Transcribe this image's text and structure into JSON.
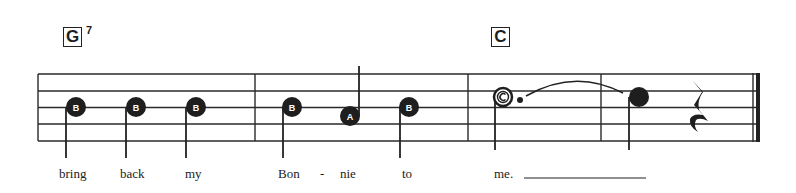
{
  "chords": [
    {
      "root": "G",
      "sup": "7"
    },
    {
      "root": "C",
      "sup": ""
    }
  ],
  "notes": [
    {
      "name": "B",
      "lyric": "bring"
    },
    {
      "name": "B",
      "lyric": "back"
    },
    {
      "name": "B",
      "lyric": "my"
    },
    {
      "name": "B",
      "lyric": "Bon"
    },
    {
      "name": "A",
      "lyric": "nie"
    },
    {
      "name": "B",
      "lyric": "to"
    },
    {
      "name": "C",
      "lyric": "me."
    }
  ],
  "hyphen": "-",
  "colors": {
    "ink": "#222222",
    "background": "#ffffff"
  }
}
